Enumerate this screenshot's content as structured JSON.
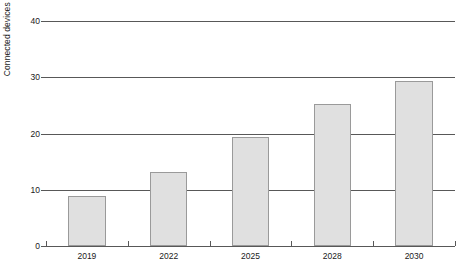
{
  "chart_data": {
    "type": "bar",
    "title": "",
    "subtitle": "",
    "xlabel": "",
    "ylabel": "Connected devices in billions",
    "categories": [
      "2019",
      "2022",
      "2025",
      "2028",
      "2030"
    ],
    "values": [
      8.9,
      13.2,
      19.3,
      25.2,
      29.3
    ],
    "ylim": [
      0,
      40
    ],
    "yticks": [
      "0",
      "10",
      "20",
      "30",
      "40"
    ],
    "ytick_values": [
      0,
      10,
      20,
      30,
      40
    ],
    "grid": "horizontal",
    "legend": "none",
    "bar_fill_color": "#e0e0e0",
    "bar_border_color": "#9a9a9a",
    "gridline_color": "#585858",
    "axis_color": "#585858",
    "background_color": "#ffffff"
  }
}
